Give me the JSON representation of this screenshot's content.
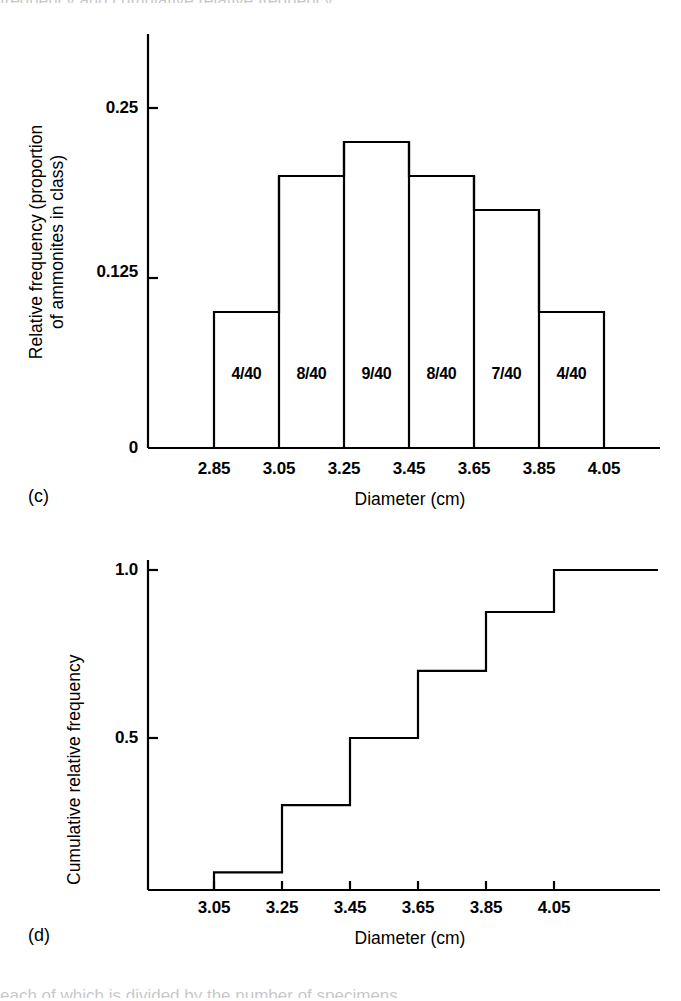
{
  "figure": {
    "panel_c_letter": "(c)",
    "panel_d_letter": "(d)",
    "cropped_top_text": "frequency and cumulative relative frequency",
    "cropped_bottom_text": "each of which is divided by the number of specimens"
  },
  "chart_data": [
    {
      "id": "histogram",
      "type": "bar",
      "title": "",
      "panel": "(c)",
      "xlabel": "Diameter (cm)",
      "ylabel": "Relative frequency (proportion of ammonites in class)",
      "ylabel_line1": "Relative frequency (proportion",
      "ylabel_line2": "of ammonites in class)",
      "bin_edges": [
        "2.85",
        "3.05",
        "3.25",
        "3.45",
        "3.65",
        "3.85",
        "4.05"
      ],
      "bin_edges_numeric": [
        2.85,
        3.05,
        3.25,
        3.45,
        3.65,
        3.85,
        4.05
      ],
      "categories": [
        "2.85-3.05",
        "3.05-3.25",
        "3.25-3.45",
        "3.45-3.65",
        "3.65-3.85",
        "3.85-4.05"
      ],
      "values": [
        0.1,
        0.2,
        0.225,
        0.2,
        0.175,
        0.1
      ],
      "counts": [
        4,
        8,
        9,
        8,
        7,
        4
      ],
      "total": 40,
      "bar_labels": [
        "4/40",
        "8/40",
        "9/40",
        "8/40",
        "7/40",
        "4/40"
      ],
      "ytick_labels": [
        "0",
        "0.125",
        "0.25"
      ],
      "yticks": [
        0,
        0.125,
        0.25
      ],
      "ylim": [
        0,
        0.285
      ],
      "xlim": [
        2.79,
        4.13
      ],
      "grid": false,
      "legend": false
    },
    {
      "id": "cumulative",
      "type": "line",
      "title": "",
      "panel": "(d)",
      "step": "post",
      "xlabel": "Diameter (cm)",
      "ylabel": "Cumulative relative frequency",
      "xtick_labels": [
        "3.05",
        "3.25",
        "3.45",
        "3.65",
        "3.85",
        "4.05"
      ],
      "xticks": [
        3.05,
        3.25,
        3.45,
        3.65,
        3.85,
        4.05
      ],
      "ytick_labels": [
        "0.5",
        "1.0"
      ],
      "yticks": [
        0.5,
        1.0
      ],
      "x": [
        3.05,
        3.25,
        3.45,
        3.65,
        3.85,
        4.05
      ],
      "values": [
        0.1,
        0.3,
        0.5,
        0.7,
        0.875,
        1.0
      ],
      "cumulative_counts": [
        4,
        12,
        20,
        28,
        35,
        40
      ],
      "ylim": [
        0,
        1.06
      ],
      "xlim": [
        2.87,
        4.19
      ],
      "grid": false,
      "legend": false
    }
  ],
  "style": {
    "ink": "#000000",
    "background": "#ffffff",
    "line_width": 2.2
  }
}
